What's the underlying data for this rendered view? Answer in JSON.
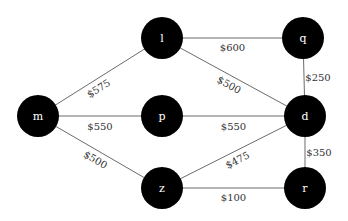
{
  "diagram": {
    "type": "weighted-graph",
    "nodes": [
      {
        "id": "l",
        "label": "l"
      },
      {
        "id": "q",
        "label": "q"
      },
      {
        "id": "m",
        "label": "m"
      },
      {
        "id": "p",
        "label": "p"
      },
      {
        "id": "d",
        "label": "d"
      },
      {
        "id": "z",
        "label": "z"
      },
      {
        "id": "r",
        "label": "r"
      }
    ],
    "edges": [
      {
        "from": "m",
        "to": "l",
        "label": "$575"
      },
      {
        "from": "m",
        "to": "p",
        "label": "$550"
      },
      {
        "from": "m",
        "to": "z",
        "label": "$500"
      },
      {
        "from": "l",
        "to": "q",
        "label": "$600"
      },
      {
        "from": "l",
        "to": "d",
        "label": "$500"
      },
      {
        "from": "p",
        "to": "d",
        "label": "$550"
      },
      {
        "from": "q",
        "to": "d",
        "label": "$250"
      },
      {
        "from": "z",
        "to": "d",
        "label": "$475"
      },
      {
        "from": "d",
        "to": "r",
        "label": "$350"
      },
      {
        "from": "z",
        "to": "r",
        "label": "$100"
      }
    ],
    "colors": {
      "node_fill": "#000000",
      "node_text": "#ffffff",
      "edge": "#6b6b6b",
      "edge_text": "#333333"
    }
  }
}
